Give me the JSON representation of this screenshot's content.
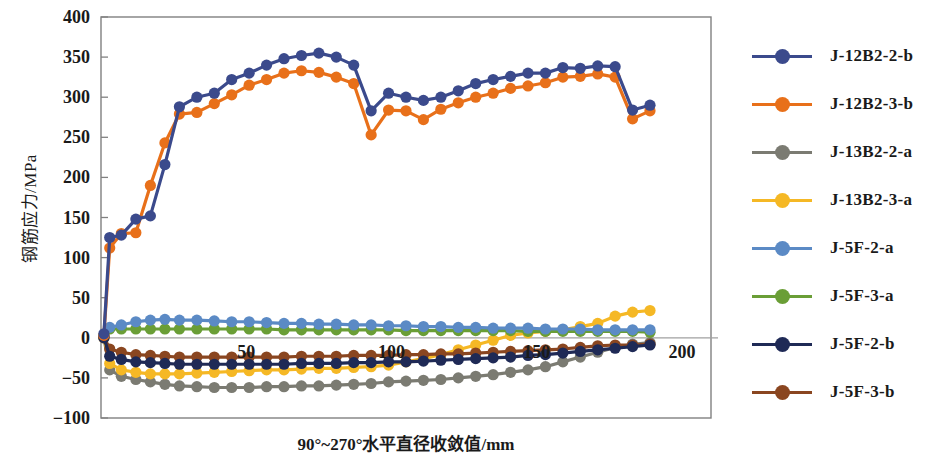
{
  "chart_data": {
    "type": "line",
    "title": "",
    "xlabel": "90°~270°水平直径收敛值/mm",
    "ylabel": "钢筋应力/MPa",
    "xlim": [
      0,
      210
    ],
    "ylim": [
      -100,
      400
    ],
    "xticks": [
      50,
      100,
      150,
      200
    ],
    "yticks": [
      -100,
      -50,
      0,
      50,
      100,
      150,
      200,
      250,
      300,
      350,
      400
    ],
    "grid": false,
    "legend_position": "right",
    "x": [
      1,
      3,
      7,
      12,
      17,
      22,
      27,
      33,
      39,
      45,
      51,
      57,
      63,
      69,
      75,
      81,
      87,
      93,
      99,
      105,
      111,
      117,
      123,
      129,
      135,
      141,
      147,
      153,
      159,
      165,
      171,
      177,
      183,
      189
    ],
    "series": [
      {
        "name": "J-12B2-2-b",
        "color": "#3b4a8c",
        "values": [
          5,
          125,
          128,
          148,
          152,
          216,
          288,
          300,
          305,
          322,
          330,
          340,
          348,
          352,
          355,
          350,
          340,
          283,
          305,
          300,
          296,
          300,
          308,
          317,
          322,
          326,
          330,
          330,
          337,
          336,
          339,
          338,
          284,
          290
        ]
      },
      {
        "name": "J-12B2-3-b",
        "color": "#e8701a",
        "values": [
          3,
          112,
          130,
          131,
          190,
          243,
          279,
          281,
          292,
          303,
          315,
          322,
          330,
          333,
          331,
          325,
          317,
          253,
          284,
          283,
          272,
          285,
          293,
          300,
          305,
          311,
          314,
          318,
          325,
          326,
          329,
          325,
          273,
          283
        ]
      },
      {
        "name": "J-13B2-2-a",
        "color": "#7b7b72",
        "values": [
          0,
          -40,
          -48,
          -52,
          -55,
          -58,
          -60,
          -61,
          -62,
          -62,
          -62,
          -61,
          -61,
          -60,
          -60,
          -59,
          -58,
          -57,
          -55,
          -54,
          -53,
          -52,
          -50,
          -48,
          -46,
          -43,
          -40,
          -36,
          -30,
          -24,
          -18,
          -12,
          -8,
          -6
        ]
      },
      {
        "name": "J-13B2-3-a",
        "color": "#f5b825",
        "values": [
          0,
          -32,
          -40,
          -43,
          -45,
          -45,
          -45,
          -44,
          -43,
          -42,
          -41,
          -40,
          -40,
          -39,
          -38,
          -38,
          -37,
          -36,
          -34,
          -30,
          -26,
          -21,
          -15,
          -9,
          -3,
          3,
          6,
          8,
          10,
          14,
          18,
          27,
          32,
          34
        ]
      },
      {
        "name": "J-5F-2-a",
        "color": "#5b8ac5",
        "values": [
          2,
          13,
          16,
          20,
          22,
          23,
          22,
          22,
          21,
          20,
          20,
          19,
          18,
          18,
          17,
          17,
          16,
          16,
          15,
          15,
          14,
          14,
          13,
          13,
          12,
          12,
          12,
          11,
          11,
          11,
          10,
          10,
          10,
          10
        ]
      },
      {
        "name": "J-5F-3-a",
        "color": "#6a9e36",
        "values": [
          3,
          11,
          11,
          11,
          11,
          11,
          11,
          11,
          11,
          11,
          11,
          11,
          10,
          10,
          10,
          10,
          10,
          10,
          10,
          9,
          9,
          9,
          9,
          9,
          9,
          9,
          8,
          8,
          8,
          8,
          8,
          8,
          8,
          7
        ]
      },
      {
        "name": "J-5F-2-b",
        "color": "#1f2a56",
        "values": [
          0,
          -23,
          -27,
          -30,
          -31,
          -32,
          -33,
          -33,
          -33,
          -33,
          -33,
          -33,
          -33,
          -32,
          -32,
          -32,
          -31,
          -31,
          -30,
          -30,
          -29,
          -28,
          -27,
          -26,
          -25,
          -24,
          -22,
          -21,
          -19,
          -17,
          -15,
          -13,
          -11,
          -9
        ]
      },
      {
        "name": "J-5F-3-b",
        "color": "#8a4620",
        "values": [
          1,
          -14,
          -18,
          -21,
          -22,
          -23,
          -24,
          -24,
          -24,
          -24,
          -24,
          -24,
          -24,
          -23,
          -23,
          -23,
          -22,
          -22,
          -22,
          -21,
          -21,
          -20,
          -20,
          -19,
          -18,
          -17,
          -16,
          -15,
          -14,
          -12,
          -10,
          -9,
          -9,
          -8
        ]
      }
    ]
  },
  "legend": {
    "items": [
      {
        "label": "J-12B2-2-b",
        "color": "#3b4a8c"
      },
      {
        "label": "J-12B2-3-b",
        "color": "#e8701a"
      },
      {
        "label": "J-13B2-2-a",
        "color": "#7b7b72"
      },
      {
        "label": "J-13B2-3-a",
        "color": "#f5b825"
      },
      {
        "label": "J-5F-2-a",
        "color": "#5b8ac5"
      },
      {
        "label": "J-5F-3-a",
        "color": "#6a9e36"
      },
      {
        "label": "J-5F-2-b",
        "color": "#1f2a56"
      },
      {
        "label": "J-5F-3-b",
        "color": "#8a4620"
      }
    ]
  },
  "axes": {
    "frame_color": "#808080",
    "zero_line_color": "#a0a0a0"
  }
}
